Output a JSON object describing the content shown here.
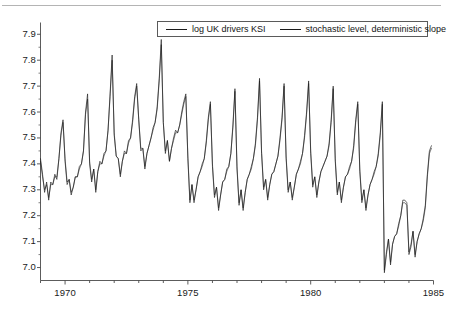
{
  "chart_data": {
    "type": "line",
    "title": "",
    "xlabel": "",
    "ylabel": "",
    "xlim": [
      1969.0,
      1985.0
    ],
    "ylim": [
      6.95,
      7.93
    ],
    "xticks": [
      1970,
      1975,
      1980,
      1985
    ],
    "xtick_labels": [
      "1970",
      "1975",
      "1980",
      "1985"
    ],
    "xminor_step": 1,
    "yticks": [
      7.0,
      7.1,
      7.2,
      7.3,
      7.4,
      7.5,
      7.6,
      7.7,
      7.8,
      7.9
    ],
    "ytick_labels": [
      "7.0",
      "7.1",
      "7.2",
      "7.3",
      "7.4",
      "7.5",
      "7.6",
      "7.7",
      "7.8",
      "7.9"
    ],
    "grid": false,
    "legend_position": "top-center",
    "line_color": "#1a1a1a",
    "frame_color": "#4a4a4a",
    "legend": [
      {
        "name": "log UK drivers KSI",
        "color": "#1a1a1a"
      },
      {
        "name": "stochastic level, deterministic slope",
        "color": "#1a1a1a"
      }
    ],
    "series": [
      {
        "name": "log UK drivers KSI",
        "color": "#1a1a1a",
        "x_start": 1969.0,
        "x_step": 0.08333333,
        "values": [
          7.42,
          7.36,
          7.29,
          7.33,
          7.26,
          7.33,
          7.32,
          7.36,
          7.34,
          7.42,
          7.52,
          7.57,
          7.41,
          7.32,
          7.34,
          7.28,
          7.31,
          7.35,
          7.35,
          7.39,
          7.4,
          7.45,
          7.6,
          7.67,
          7.4,
          7.33,
          7.38,
          7.29,
          7.37,
          7.41,
          7.4,
          7.44,
          7.45,
          7.53,
          7.67,
          7.82,
          7.51,
          7.43,
          7.42,
          7.35,
          7.41,
          7.45,
          7.44,
          7.49,
          7.5,
          7.57,
          7.66,
          7.71,
          7.57,
          7.45,
          7.46,
          7.38,
          7.44,
          7.47,
          7.5,
          7.54,
          7.56,
          7.62,
          7.73,
          7.88,
          7.56,
          7.44,
          7.49,
          7.41,
          7.46,
          7.5,
          7.53,
          7.52,
          7.55,
          7.6,
          7.64,
          7.67,
          7.42,
          7.25,
          7.32,
          7.25,
          7.3,
          7.35,
          7.37,
          7.4,
          7.42,
          7.49,
          7.58,
          7.64,
          7.39,
          7.27,
          7.31,
          7.22,
          7.28,
          7.33,
          7.34,
          7.38,
          7.39,
          7.44,
          7.55,
          7.69,
          7.38,
          7.24,
          7.3,
          7.22,
          7.29,
          7.34,
          7.36,
          7.39,
          7.42,
          7.48,
          7.58,
          7.73,
          7.44,
          7.3,
          7.34,
          7.26,
          7.32,
          7.36,
          7.37,
          7.4,
          7.43,
          7.5,
          7.58,
          7.71,
          7.42,
          7.29,
          7.33,
          7.26,
          7.31,
          7.36,
          7.38,
          7.41,
          7.44,
          7.51,
          7.6,
          7.72,
          7.44,
          7.31,
          7.35,
          7.27,
          7.33,
          7.37,
          7.39,
          7.41,
          7.43,
          7.48,
          7.57,
          7.7,
          7.41,
          7.28,
          7.33,
          7.25,
          7.31,
          7.35,
          7.36,
          7.39,
          7.41,
          7.47,
          7.57,
          7.64,
          7.37,
          7.25,
          7.3,
          7.22,
          7.28,
          7.32,
          7.34,
          7.37,
          7.39,
          7.44,
          7.52,
          7.64,
          6.98,
          7.05,
          7.11,
          7.01,
          7.09,
          7.12,
          7.13,
          7.17,
          7.2,
          7.26,
          7.26,
          7.25,
          7.05,
          7.08,
          7.14,
          7.04,
          7.1,
          7.13,
          7.15,
          7.19,
          7.24,
          7.36,
          7.45,
          7.47
        ]
      },
      {
        "name": "stochastic level, deterministic slope",
        "color": "#1a1a1a",
        "x_start": 1969.0,
        "x_step": 0.08333333,
        "values": [
          7.41,
          7.35,
          7.3,
          7.32,
          7.27,
          7.32,
          7.32,
          7.35,
          7.35,
          7.42,
          7.51,
          7.56,
          7.42,
          7.33,
          7.34,
          7.29,
          7.31,
          7.35,
          7.35,
          7.38,
          7.4,
          7.45,
          7.59,
          7.65,
          7.41,
          7.34,
          7.38,
          7.3,
          7.37,
          7.4,
          7.4,
          7.43,
          7.45,
          7.53,
          7.66,
          7.8,
          7.52,
          7.43,
          7.42,
          7.36,
          7.41,
          7.44,
          7.44,
          7.48,
          7.5,
          7.56,
          7.65,
          7.7,
          7.57,
          7.46,
          7.46,
          7.39,
          7.44,
          7.47,
          7.5,
          7.53,
          7.56,
          7.61,
          7.72,
          7.86,
          7.56,
          7.45,
          7.49,
          7.41,
          7.46,
          7.49,
          7.52,
          7.52,
          7.55,
          7.59,
          7.63,
          7.66,
          7.43,
          7.26,
          7.32,
          7.26,
          7.3,
          7.35,
          7.37,
          7.39,
          7.42,
          7.48,
          7.57,
          7.63,
          7.4,
          7.28,
          7.31,
          7.23,
          7.28,
          7.33,
          7.34,
          7.37,
          7.39,
          7.44,
          7.54,
          7.68,
          7.39,
          7.25,
          7.3,
          7.23,
          7.29,
          7.34,
          7.36,
          7.38,
          7.42,
          7.47,
          7.57,
          7.72,
          7.45,
          7.31,
          7.34,
          7.27,
          7.32,
          7.36,
          7.37,
          7.4,
          7.43,
          7.49,
          7.57,
          7.7,
          7.43,
          7.3,
          7.33,
          7.27,
          7.31,
          7.36,
          7.38,
          7.4,
          7.44,
          7.5,
          7.59,
          7.71,
          7.45,
          7.32,
          7.35,
          7.28,
          7.33,
          7.37,
          7.39,
          7.41,
          7.43,
          7.47,
          7.56,
          7.69,
          7.42,
          7.29,
          7.33,
          7.26,
          7.31,
          7.35,
          7.36,
          7.38,
          7.41,
          7.46,
          7.56,
          7.63,
          7.38,
          7.26,
          7.3,
          7.23,
          7.28,
          7.32,
          7.34,
          7.36,
          7.39,
          7.43,
          7.51,
          7.63,
          6.99,
          7.06,
          7.11,
          7.02,
          7.09,
          7.12,
          7.13,
          7.16,
          7.2,
          7.25,
          7.25,
          7.24,
          7.06,
          7.09,
          7.14,
          7.05,
          7.1,
          7.13,
          7.15,
          7.18,
          7.23,
          7.35,
          7.44,
          7.46
        ]
      }
    ]
  }
}
